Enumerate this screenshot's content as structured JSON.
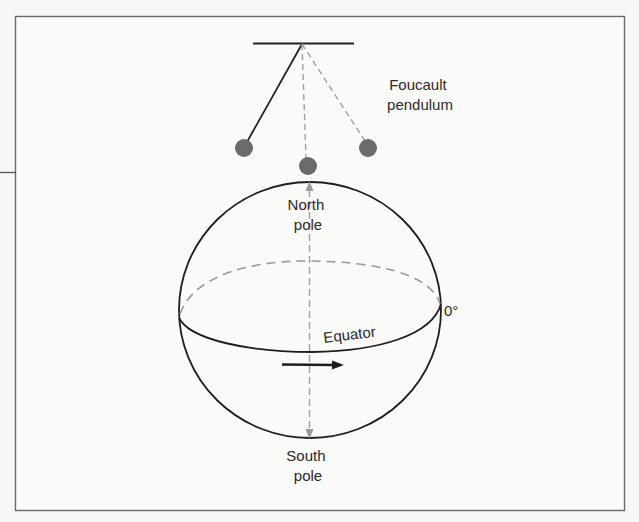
{
  "figure": {
    "title_label": {
      "line1": "Foucault",
      "line2": "pendulum"
    },
    "north_pole": {
      "line1": "North",
      "line2": "pole"
    },
    "south_pole": {
      "line1": "South",
      "line2": "pole"
    },
    "equator_label": "Equator",
    "longitude_label": "0°",
    "colors": {
      "background": "#f7f7f6",
      "frame": "#6a6a6a",
      "line": "#1e1e1e",
      "dashed": "#9a9a9a",
      "bob": "#6b6b6b",
      "text": "#2a2a2a"
    },
    "pendulum_positions": [
      "left-swing",
      "center-rest",
      "right-swing"
    ],
    "rotation_direction": "left-to-right"
  }
}
